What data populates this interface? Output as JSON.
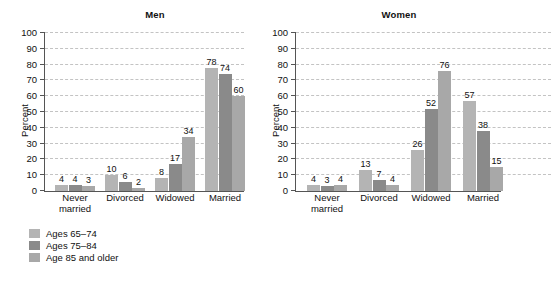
{
  "chart_data": [
    {
      "type": "bar",
      "title": "Men",
      "xlabel": "",
      "ylabel": "Percent",
      "ylim": [
        0,
        100
      ],
      "ytick_labels": [
        "0",
        "10",
        "20",
        "30",
        "40",
        "50",
        "60",
        "70",
        "80",
        "90",
        "100"
      ],
      "grid": true,
      "legend_position": "below-left",
      "categories": [
        "Never\nmarried",
        "Divorced",
        "Widowed",
        "Married"
      ],
      "series": [
        {
          "name": "Ages 65–74",
          "values": [
            4,
            10,
            8,
            78
          ]
        },
        {
          "name": "Ages 75–84",
          "values": [
            4,
            6,
            17,
            74
          ]
        },
        {
          "name": "Age 85 and older",
          "values": [
            3,
            2,
            34,
            60
          ]
        }
      ]
    },
    {
      "type": "bar",
      "title": "Women",
      "xlabel": "",
      "ylabel": "Percent",
      "ylim": [
        0,
        100
      ],
      "ytick_labels": [
        "0",
        "10",
        "20",
        "30",
        "40",
        "50",
        "60",
        "70",
        "80",
        "90",
        "100"
      ],
      "grid": true,
      "legend_position": "below-left",
      "categories": [
        "Never\nmarried",
        "Divorced",
        "Widowed",
        "Married"
      ],
      "series": [
        {
          "name": "Ages 65–74",
          "values": [
            4,
            13,
            26,
            57
          ]
        },
        {
          "name": "Ages 75–84",
          "values": [
            3,
            7,
            52,
            38
          ]
        },
        {
          "name": "Age 85 and older",
          "values": [
            4,
            4,
            76,
            15
          ]
        }
      ]
    }
  ],
  "legend": {
    "items": [
      {
        "label": "Ages 65–74",
        "color": "#b4b4b4"
      },
      {
        "label": "Ages 75–84",
        "color": "#8a8a8a"
      },
      {
        "label": "Age 85 and older",
        "color": "#a8a8a8"
      }
    ]
  },
  "colors": {
    "series_1": "#b4b4b4",
    "series_2": "#8a8a8a",
    "series_3": "#a8a8a8",
    "axis": "#555555",
    "gridline": "#c3c3c3",
    "text": "#111111",
    "background": "#ffffff"
  },
  "footnote": ""
}
